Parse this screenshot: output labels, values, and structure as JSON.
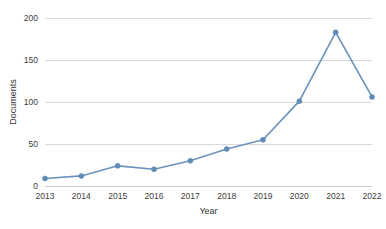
{
  "chart_data": {
    "type": "line",
    "title": "",
    "subtitle": "",
    "xlabel": "Year",
    "ylabel": "Documents",
    "categories": [
      "2013",
      "2014",
      "2015",
      "2016",
      "2017",
      "2018",
      "2019",
      "2020",
      "2021",
      "2022"
    ],
    "x": [
      2013,
      2014,
      2015,
      2016,
      2017,
      2018,
      2019,
      2020,
      2021,
      2022
    ],
    "values": [
      9,
      12,
      24,
      20,
      30,
      44,
      55,
      101,
      183,
      106
    ],
    "series": [
      {
        "name": "Documents",
        "values": [
          9,
          12,
          24,
          20,
          30,
          44,
          55,
          101,
          183,
          106
        ],
        "color": "#5f8cb6",
        "marker": "circle"
      }
    ],
    "xlim": [
      2013,
      2022
    ],
    "ylim": [
      0,
      200
    ],
    "yticks": [
      0,
      50,
      100,
      150,
      200
    ],
    "ytick_labels": [
      "0",
      "50",
      "100",
      "150",
      "200"
    ],
    "xticks": [
      2013,
      2014,
      2015,
      2016,
      2017,
      2018,
      2019,
      2020,
      2021,
      2022
    ],
    "xtick_labels": [
      "2013",
      "2014",
      "2015",
      "2016",
      "2017",
      "2018",
      "2019",
      "2020",
      "2021",
      "2022"
    ],
    "grid": {
      "horizontal": true,
      "vertical": false,
      "color": "#d9d9d9"
    },
    "legend": {
      "visible": false,
      "position": "none",
      "entries": []
    },
    "annotations": [],
    "colors": {
      "line": "#6a93bb",
      "marker": "#5f8cb6",
      "grid": "#d9d9d9",
      "axis": "#c9c9c9",
      "text": "#3d3d3d",
      "background": "#ffffff"
    }
  }
}
